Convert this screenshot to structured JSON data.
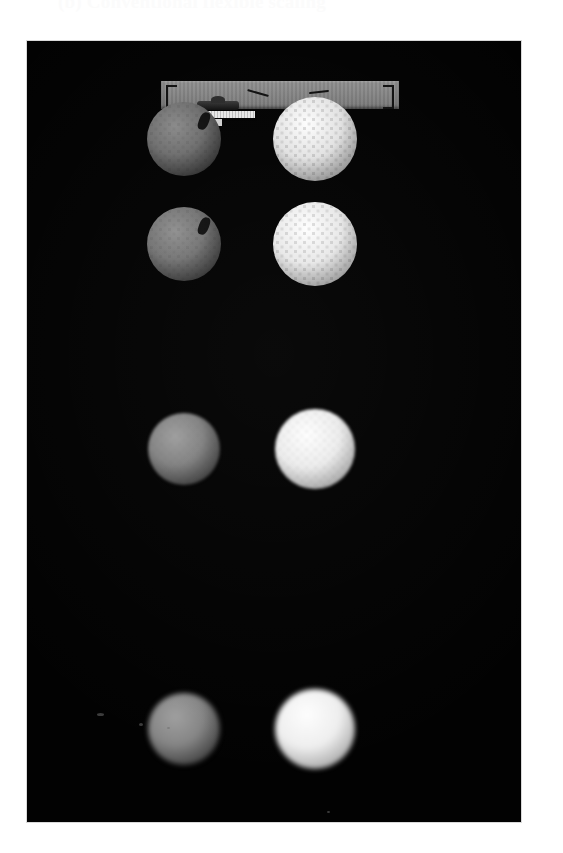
{
  "caption": {
    "text": "(b) Conventional flexible scaling"
  },
  "photo": {
    "alt_name": "golf-ball-comparison-photograph",
    "background_color": "#020202",
    "frame": {
      "x": 27,
      "y": 41,
      "width": 494,
      "height": 781
    }
  },
  "rail": {
    "name": "gray-reference-rail",
    "color": "#848484",
    "brackets": [
      "left-bracket",
      "right-bracket"
    ],
    "tick_marks": 2,
    "clip_label": "clamp-fixture",
    "strip_label": "pale-scale-strip"
  },
  "rows": [
    {
      "index": 1,
      "label": "row-1",
      "left": {
        "name": "ball-left-row-1",
        "finish": "matte gray",
        "hi": "#8a8a8a",
        "mid": "#6e6e6e",
        "lo": "#3a3a3a",
        "edge": "#141414",
        "size": 74,
        "blemish": true,
        "dimple_opacity": 0.3,
        "blur": "soft1"
      },
      "right": {
        "name": "ball-right-row-1",
        "finish": "bright dimpled white",
        "hi": "#fdfdfd",
        "mid": "#e2e2e2",
        "lo": "#9a9a9a",
        "edge": "#2a2a2a",
        "size": 84,
        "blemish": false,
        "dimple_opacity": 0.62,
        "blur": "soft1"
      }
    },
    {
      "index": 2,
      "label": "row-2",
      "left": {
        "name": "ball-left-row-2",
        "finish": "matte gray",
        "hi": "#909090",
        "mid": "#747474",
        "lo": "#3e3e3e",
        "edge": "#141414",
        "size": 74,
        "blemish": true,
        "dimple_opacity": 0.28,
        "blur": "soft1"
      },
      "right": {
        "name": "ball-right-row-2",
        "finish": "bright dimpled white",
        "hi": "#fefefe",
        "mid": "#e8e8e8",
        "lo": "#a2a2a2",
        "edge": "#2a2a2a",
        "size": 84,
        "blemish": false,
        "dimple_opacity": 0.58,
        "blur": "soft1"
      }
    },
    {
      "index": 3,
      "label": "row-3",
      "left": {
        "name": "ball-left-row-3",
        "finish": "matte gray, softer focus",
        "hi": "#9e9e9e",
        "mid": "#828282",
        "lo": "#464646",
        "edge": "#151515",
        "size": 72,
        "blemish": false,
        "dimple_opacity": 0.18,
        "blur": "soft2"
      },
      "right": {
        "name": "ball-right-row-3",
        "finish": "bright white, softer focus",
        "hi": "#ffffff",
        "mid": "#ededed",
        "lo": "#ababab",
        "edge": "#2c2c2c",
        "size": 80,
        "blemish": false,
        "dimple_opacity": 0.34,
        "blur": "soft2"
      }
    },
    {
      "index": 4,
      "label": "row-4",
      "left": {
        "name": "ball-left-row-4",
        "finish": "matte gray, out of focus",
        "hi": "#a0a0a0",
        "mid": "#868686",
        "lo": "#4a4a4a",
        "edge": "#121212",
        "size": 72,
        "blemish": false,
        "dimple_opacity": 0.1,
        "blur": "soft3"
      },
      "right": {
        "name": "ball-right-row-4",
        "finish": "bright white, out of focus",
        "hi": "#ffffff",
        "mid": "#f0f0f0",
        "lo": "#b0b0b0",
        "edge": "#242424",
        "size": 80,
        "blemish": false,
        "dimple_opacity": 0.18,
        "blur": "soft3"
      }
    }
  ],
  "specks": [
    {
      "name": "background-speck-1",
      "x": 70,
      "y": 672,
      "w": 7,
      "h": 3
    },
    {
      "name": "background-speck-2",
      "x": 112,
      "y": 682,
      "w": 4,
      "h": 3
    },
    {
      "name": "background-speck-3",
      "x": 140,
      "y": 686,
      "w": 3,
      "h": 2
    },
    {
      "name": "background-speck-4",
      "x": 300,
      "y": 770,
      "w": 3,
      "h": 2
    }
  ]
}
